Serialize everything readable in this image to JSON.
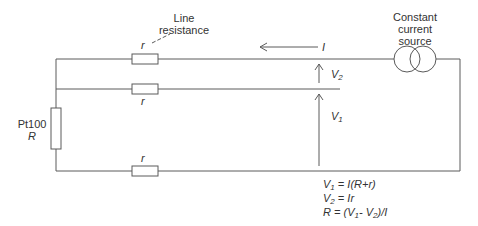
{
  "diagram": {
    "labels": {
      "line_resistance_1": "Line",
      "line_resistance_2": "resistance",
      "source_1": "Constant",
      "source_2": "current",
      "source_3": "source",
      "current": "I",
      "sensor_name": "Pt100",
      "sensor_symbol": "R",
      "r_top": "r",
      "r_mid": "r",
      "r_bottom": "r",
      "v2_main": "V",
      "v2_sub": "2",
      "v1_main": "V",
      "v1_sub": "1"
    },
    "equations": [
      {
        "lhs": "V",
        "sub": "1",
        "rhs": " = I(R+r)"
      },
      {
        "lhs": "V",
        "sub": "2",
        "rhs": " = Ir"
      },
      {
        "lhs": "R",
        "sub": "",
        "rhs_a": " = (V",
        "sub_a": "1",
        "rhs_b": "- V",
        "sub_b": "2",
        "rhs_c": ")/I"
      }
    ],
    "colors": {
      "line": "#555555",
      "text": "#333333"
    }
  }
}
